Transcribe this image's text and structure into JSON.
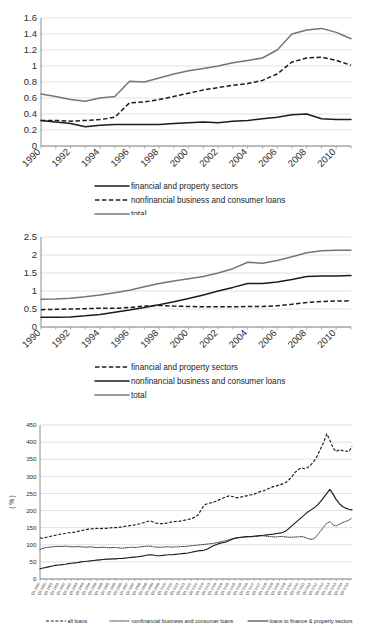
{
  "page": {
    "width": 366,
    "height": 642,
    "background": "#ffffff"
  },
  "charts": [
    {
      "id": "chart-1",
      "title": "",
      "y_axis": {
        "label": "",
        "min": 0,
        "max": 1.6,
        "step": 0.2,
        "ticks": [
          "0",
          "0.2",
          "0.4",
          "0.6",
          "0.8",
          "1",
          "1.2",
          "1.4",
          "1.6"
        ]
      },
      "x_axis": {
        "label": "",
        "min": 1990,
        "max": 2011,
        "ticks": [
          "1990",
          "1992",
          "1994",
          "1996",
          "1998",
          "2000",
          "2002",
          "2004",
          "2006",
          "2008",
          "2010"
        ]
      },
      "legend": [
        {
          "label": "financial and property sectors",
          "style": "solid",
          "color": "#1c1c1c"
        },
        {
          "label": "nonfinancial business and consumer loans",
          "style": "dashed",
          "color": "#1c1c1c"
        },
        {
          "label": "total",
          "style": "solid",
          "color": "#757575"
        }
      ]
    },
    {
      "id": "chart-2",
      "title": "",
      "y_axis": {
        "label": "",
        "min": 0,
        "max": 2.5,
        "step": 0.5,
        "ticks": [
          "0",
          "0.5",
          "1",
          "1.5",
          "2",
          "2.5"
        ]
      },
      "x_axis": {
        "label": "",
        "min": 1990,
        "max": 2011,
        "ticks": [
          "1990",
          "1992",
          "1994",
          "1996",
          "1998",
          "2000",
          "2002",
          "2004",
          "2006",
          "2008",
          "2010"
        ]
      },
      "legend": [
        {
          "label": "financial and property sectors",
          "style": "dashed",
          "color": "#1c1c1c"
        },
        {
          "label": "nonfinancial business and consumer loans",
          "style": "solid",
          "color": "#1c1c1c"
        },
        {
          "label": "total",
          "style": "solid",
          "color": "#757575"
        }
      ]
    },
    {
      "id": "chart-3",
      "title": "",
      "y_axis": {
        "label": "( % )",
        "min": 0,
        "max": 450,
        "step": 50,
        "ticks": [
          "0",
          "50",
          "100",
          "150",
          "200",
          "250",
          "300",
          "350",
          "400",
          "450"
        ]
      },
      "x_axis": {
        "label": "",
        "min": 1990,
        "max": 2011,
        "tick_format": "quarterly"
      },
      "legend": [
        {
          "label": "all loans",
          "style": "dashed",
          "color": "#1c1c1c"
        },
        {
          "label": "nonfinancial business and consumer loans",
          "style": "dotted",
          "color": "#3a3a3a"
        },
        {
          "label": "loans to finance & property sectors",
          "style": "solid",
          "color": "#1c1c1c"
        }
      ]
    }
  ],
  "chart_data": [
    {
      "type": "line",
      "title": "",
      "xlabel": "",
      "ylabel": "",
      "xlim": [
        1990,
        2011
      ],
      "ylim": [
        0,
        1.6
      ],
      "grid": true,
      "legend_position": "bottom",
      "x": [
        1990,
        1991,
        1992,
        1993,
        1994,
        1995,
        1996,
        1997,
        1998,
        1999,
        2000,
        2001,
        2002,
        2003,
        2004,
        2005,
        2006,
        2007,
        2008,
        2009,
        2010,
        2011
      ],
      "series": [
        {
          "name": "financial and property sectors",
          "style": "solid",
          "color": "#1c1c1c",
          "values": [
            0.32,
            0.3,
            0.28,
            0.24,
            0.26,
            0.27,
            0.27,
            0.27,
            0.27,
            0.28,
            0.29,
            0.3,
            0.29,
            0.31,
            0.32,
            0.34,
            0.36,
            0.39,
            0.4,
            0.34,
            0.33,
            0.33
          ]
        },
        {
          "name": "nonfinancial business and consumer loans",
          "style": "dashed",
          "color": "#1c1c1c",
          "values": [
            0.32,
            0.32,
            0.31,
            0.32,
            0.33,
            0.36,
            0.54,
            0.55,
            0.58,
            0.62,
            0.66,
            0.7,
            0.73,
            0.76,
            0.78,
            0.82,
            0.9,
            1.05,
            1.1,
            1.11,
            1.07,
            1.01
          ]
        },
        {
          "name": "total",
          "style": "solid",
          "color": "#757575",
          "values": [
            0.65,
            0.62,
            0.58,
            0.56,
            0.6,
            0.62,
            0.81,
            0.8,
            0.85,
            0.9,
            0.94,
            0.97,
            1.0,
            1.04,
            1.07,
            1.1,
            1.2,
            1.4,
            1.45,
            1.47,
            1.42,
            1.34
          ]
        }
      ]
    },
    {
      "type": "line",
      "title": "",
      "xlabel": "",
      "ylabel": "",
      "xlim": [
        1990,
        2011
      ],
      "ylim": [
        0,
        2.5
      ],
      "grid": true,
      "legend_position": "bottom",
      "x": [
        1990,
        1991,
        1992,
        1993,
        1994,
        1995,
        1996,
        1997,
        1998,
        1999,
        2000,
        2001,
        2002,
        2003,
        2004,
        2005,
        2006,
        2007,
        2008,
        2009,
        2010,
        2011
      ],
      "series": [
        {
          "name": "financial and property sectors",
          "style": "dashed",
          "color": "#1c1c1c",
          "values": [
            0.48,
            0.49,
            0.5,
            0.51,
            0.52,
            0.52,
            0.54,
            0.58,
            0.6,
            0.58,
            0.57,
            0.56,
            0.56,
            0.56,
            0.57,
            0.57,
            0.59,
            0.63,
            0.68,
            0.71,
            0.72,
            0.73
          ]
        },
        {
          "name": "nonfinancial business and consumer loans",
          "style": "solid",
          "color": "#1c1c1c",
          "values": [
            0.27,
            0.27,
            0.28,
            0.31,
            0.35,
            0.41,
            0.47,
            0.54,
            0.62,
            0.7,
            0.79,
            0.89,
            1.0,
            1.1,
            1.21,
            1.21,
            1.25,
            1.32,
            1.4,
            1.42,
            1.42,
            1.43
          ]
        },
        {
          "name": "total",
          "style": "solid",
          "color": "#757575",
          "values": [
            0.77,
            0.78,
            0.8,
            0.84,
            0.89,
            0.95,
            1.02,
            1.12,
            1.21,
            1.28,
            1.34,
            1.4,
            1.5,
            1.62,
            1.8,
            1.77,
            1.85,
            1.95,
            2.06,
            2.12,
            2.13,
            2.13
          ]
        }
      ]
    },
    {
      "type": "line",
      "title": "",
      "xlabel": "",
      "ylabel": "( % )",
      "xlim": [
        1990,
        2011.75
      ],
      "ylim": [
        0,
        450
      ],
      "grid": true,
      "legend_position": "bottom",
      "x_note": "quarterly, 1990Q1 through 2011Q4",
      "series": [
        {
          "name": "all loans",
          "style": "dashed",
          "color": "#1c1c1c",
          "values": [
            120,
            119,
            122,
            124,
            126,
            128,
            130,
            132,
            133,
            135,
            136,
            137,
            139,
            141,
            143,
            145,
            146,
            147,
            148,
            147,
            148,
            148,
            149,
            150,
            150,
            151,
            152,
            154,
            155,
            157,
            158,
            160,
            162,
            165,
            168,
            170,
            166,
            163,
            162,
            162,
            163,
            165,
            167,
            168,
            168,
            170,
            172,
            174,
            176,
            180,
            186,
            200,
            215,
            220,
            222,
            224,
            228,
            232,
            236,
            240,
            243,
            241,
            238,
            238,
            240,
            242,
            244,
            246,
            248,
            252,
            256,
            258,
            262,
            266,
            270,
            272,
            275,
            278,
            282,
            290,
            300,
            312,
            320,
            325,
            322,
            326,
            334,
            345,
            360,
            380,
            400,
            424,
            405,
            383,
            372,
            378,
            375,
            374,
            372,
            388
          ]
        },
        {
          "name": "nonfinancial business and consumer loans",
          "style": "dotted",
          "color": "#3a3a3a",
          "values": [
            86,
            90,
            92,
            93,
            94,
            95,
            95,
            95,
            96,
            95,
            94,
            94,
            95,
            94,
            93,
            93,
            94,
            93,
            92,
            92,
            93,
            92,
            91,
            92,
            92,
            91,
            90,
            91,
            92,
            93,
            92,
            93,
            94,
            95,
            96,
            96,
            94,
            93,
            93,
            93,
            94,
            94,
            93,
            94,
            94,
            95,
            95,
            96,
            97,
            98,
            99,
            100,
            101,
            102,
            103,
            104,
            106,
            108,
            110,
            112,
            115,
            118,
            120,
            121,
            122,
            123,
            124,
            124,
            125,
            125,
            126,
            126,
            125,
            124,
            123,
            123,
            124,
            124,
            123,
            122,
            122,
            123,
            123,
            124,
            122,
            118,
            116,
            118,
            128,
            140,
            152,
            163,
            168,
            158,
            155,
            160,
            165,
            168,
            172,
            178
          ]
        },
        {
          "name": "loans to finance & property sectors",
          "style": "solid",
          "color": "#1c1c1c",
          "values": [
            30,
            32,
            34,
            36,
            38,
            40,
            41,
            42,
            43,
            45,
            46,
            47,
            48,
            50,
            51,
            52,
            53,
            54,
            55,
            56,
            57,
            58,
            58,
            59,
            59,
            60,
            60,
            61,
            62,
            63,
            64,
            65,
            66,
            68,
            70,
            71,
            70,
            68,
            68,
            69,
            70,
            71,
            71,
            72,
            73,
            74,
            75,
            76,
            78,
            80,
            82,
            83,
            84,
            87,
            92,
            97,
            101,
            104,
            106,
            108,
            112,
            116,
            119,
            121,
            122,
            123,
            124,
            124,
            125,
            126,
            127,
            128,
            129,
            130,
            131,
            133,
            134,
            136,
            140,
            148,
            156,
            164,
            172,
            180,
            188,
            196,
            202,
            208,
            216,
            226,
            238,
            250,
            262,
            248,
            232,
            220,
            212,
            207,
            204,
            202
          ]
        }
      ]
    }
  ]
}
